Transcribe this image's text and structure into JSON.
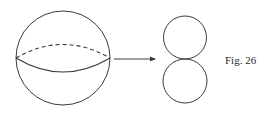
{
  "figure": {
    "label": "Fig. 26",
    "stroke_color": "#3a3a3a",
    "sphere": {
      "cx": 63,
      "cy": 58,
      "r": 47,
      "equator_front": "solid",
      "equator_back": "dashed"
    },
    "arrow": {
      "x1": 114,
      "y1": 59,
      "x2": 156,
      "y2": 59,
      "direction": "right"
    },
    "result": {
      "description": "two tangent circles stacked vertically",
      "top_circle": {
        "cx": 185,
        "cy": 37.5,
        "r": 21.5
      },
      "bottom_circle": {
        "cx": 185,
        "cy": 81,
        "r": 22
      }
    }
  }
}
